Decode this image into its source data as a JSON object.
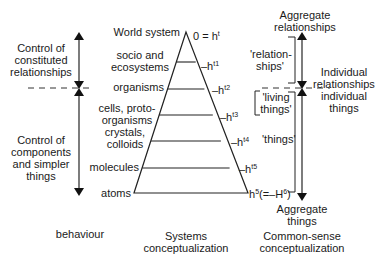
{
  "left_column": {
    "upper_label": [
      "Control of",
      "constituted",
      "relationships"
    ],
    "lower_label": [
      "Control of",
      "components",
      "and simpler",
      "things"
    ],
    "footer": "behaviour"
  },
  "pyramid": {
    "levels": [
      {
        "label": "World system",
        "marker": "0 = h",
        "sup": "t"
      },
      {
        "label": "socio and\necosystems",
        "marker": "–h",
        "sup": "t1"
      },
      {
        "label": "organisms",
        "marker": "–h",
        "sup": "t2"
      },
      {
        "label": "cells, proto-\norganisms",
        "marker": "–h",
        "sup": "t3"
      },
      {
        "label": "crystals,\ncolloids",
        "marker": "–h",
        "sup": "t4"
      },
      {
        "label": "molecules",
        "marker": "–h",
        "sup": "t5"
      },
      {
        "label": "atoms",
        "marker": "h",
        "sup": "5",
        "suffix": "(=–H",
        "suffix_sup": "6",
        "suffix_end": ")"
      }
    ],
    "footer": [
      "Systems",
      "conceptualization"
    ]
  },
  "right_column": {
    "top": [
      "Aggregate",
      "relationships"
    ],
    "bracket_relationships": [
      "'relation-",
      "ships'"
    ],
    "bracket_living": [
      "'living",
      "things'"
    ],
    "bracket_things": "'things'",
    "middle": [
      "Individual",
      "relationships",
      "individual",
      "things"
    ],
    "bottom": [
      "Aggregate",
      "things"
    ],
    "footer": [
      "Common-sense",
      "conceptualization"
    ]
  }
}
